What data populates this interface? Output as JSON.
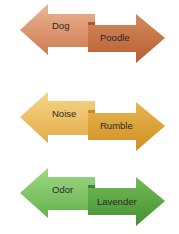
{
  "diagram": {
    "pairs": [
      {
        "left_label": "Dog",
        "right_label": "Poodle",
        "color_light": "#e4a47f",
        "color_dark": "#c0683a",
        "top": 0
      },
      {
        "left_label": "Noise",
        "right_label": "Rumble",
        "color_light": "#f2c970",
        "color_dark": "#d6982a",
        "top": 88
      },
      {
        "left_label": "Odor",
        "right_label": "Lavender",
        "color_light": "#8fcf74",
        "color_dark": "#4c9838",
        "top": 164
      }
    ]
  }
}
